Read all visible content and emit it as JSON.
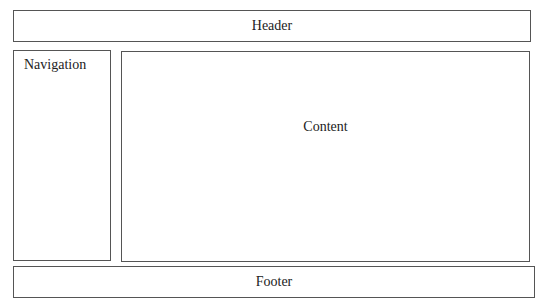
{
  "diagram": {
    "type": "page-layout wireframe",
    "header": {
      "label": "Header"
    },
    "navigation": {
      "label": "Navigation"
    },
    "content": {
      "label": "Content"
    },
    "footer": {
      "label": "Footer"
    }
  },
  "colors": {
    "border": "#555555",
    "background": "#ffffff",
    "text": "#222222"
  }
}
